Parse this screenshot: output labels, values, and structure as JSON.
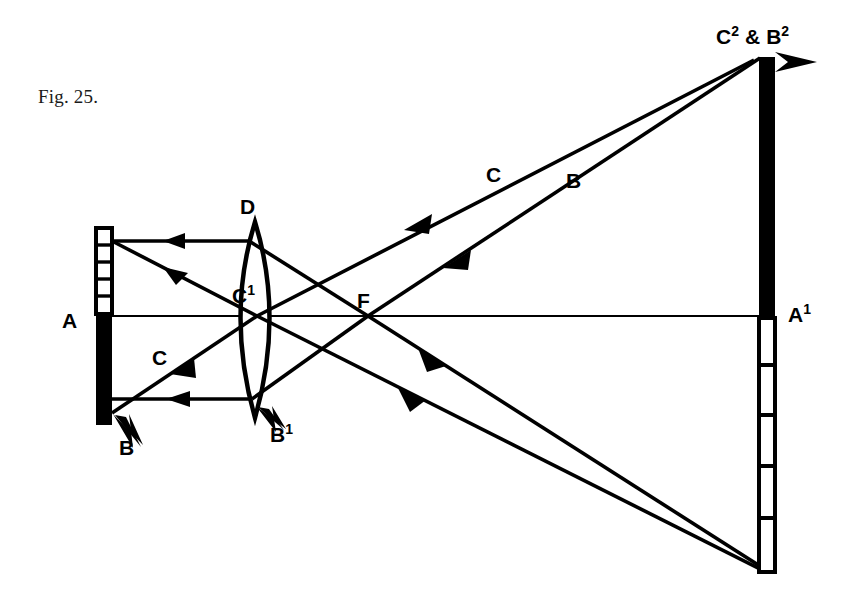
{
  "figure": {
    "caption": "Fig. 25.",
    "caption_x": 38,
    "caption_y": 98,
    "background_color": "#ffffff",
    "ink_color": "#000000"
  },
  "labels": {
    "object_axis": "A",
    "object_bottom": "B",
    "object_mid_ray": "C",
    "lens_top": "D",
    "lens_center": "C",
    "lens_center_sup": "1",
    "lens_bottom": "B",
    "lens_bottom_sup": "1",
    "focal_point": "F",
    "upper_ray_c": "C",
    "upper_ray_b": "B",
    "image_top": "C",
    "image_top_sup": "2",
    "image_top_amp": "&",
    "image_top_b": "B",
    "image_top_b_sup": "2",
    "image_axis": "A",
    "image_axis_sup": "1"
  },
  "geometry": {
    "axis_y": 316,
    "object_x": 104,
    "object_top_y": 228,
    "object_bottom_y": 425,
    "lens_center_x": 255,
    "lens_top_y": 222,
    "lens_bottom_y": 418,
    "focal_x": 368,
    "image_x": 767,
    "image_top_y": 57,
    "image_bottom_y": 572
  },
  "elements": {
    "object_segments_count": 5,
    "image_segments_count": 5,
    "object_bar_name": "object-arrow-AB",
    "image_bar_name": "image-arrow-A1B1",
    "lens_name": "convex-lens"
  }
}
